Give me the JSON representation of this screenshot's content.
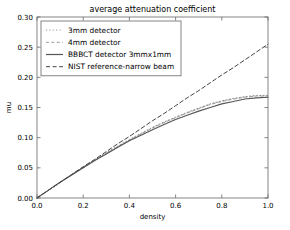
{
  "chart_data": {
    "type": "line",
    "title": "average attenuation coefficient",
    "xlabel": "density",
    "ylabel": "mu",
    "xlim": [
      0.0,
      1.0
    ],
    "ylim": [
      0.0,
      0.3
    ],
    "xticks": [
      "0.0",
      "0.2",
      "0.4",
      "0.6",
      "0.8",
      "1.0"
    ],
    "xtick_values": [
      0.0,
      0.2,
      0.4,
      0.6,
      0.8,
      1.0
    ],
    "yticks": [
      "0.00",
      "0.05",
      "0.10",
      "0.15",
      "0.20",
      "0.25",
      "0.30"
    ],
    "ytick_values": [
      0.0,
      0.05,
      0.1,
      0.15,
      0.2,
      0.25,
      0.3
    ],
    "grid": false,
    "legend_position": "upper left",
    "x": [
      0.0,
      0.05,
      0.1,
      0.15,
      0.2,
      0.25,
      0.3,
      0.35,
      0.4,
      0.45,
      0.5,
      0.55,
      0.6,
      0.65,
      0.7,
      0.75,
      0.8,
      0.85,
      0.9,
      0.95,
      1.0
    ],
    "series": [
      {
        "name": "3mm detector",
        "style": "dotted",
        "color": "#888888",
        "values": [
          0.0,
          0.013,
          0.026,
          0.039,
          0.051,
          0.063,
          0.075,
          0.086,
          0.097,
          0.107,
          0.117,
          0.126,
          0.134,
          0.142,
          0.149,
          0.156,
          0.161,
          0.165,
          0.168,
          0.17,
          0.17
        ]
      },
      {
        "name": "4mm detector",
        "style": "dashed",
        "color": "#999999",
        "values": [
          0.0,
          0.013,
          0.026,
          0.038,
          0.05,
          0.062,
          0.074,
          0.085,
          0.096,
          0.106,
          0.116,
          0.125,
          0.133,
          0.141,
          0.148,
          0.155,
          0.16,
          0.164,
          0.167,
          0.169,
          0.169
        ]
      },
      {
        "name": "BBBCT detector 3mmx1mm",
        "style": "solid",
        "color": "#555555",
        "values": [
          0.0,
          0.013,
          0.026,
          0.038,
          0.05,
          0.062,
          0.073,
          0.084,
          0.095,
          0.104,
          0.113,
          0.122,
          0.13,
          0.137,
          0.144,
          0.15,
          0.156,
          0.16,
          0.164,
          0.166,
          0.167
        ]
      },
      {
        "name": "NIST reference-narrow beam",
        "style": "dashed-long",
        "color": "#444444",
        "values": [
          0.0,
          0.013,
          0.026,
          0.039,
          0.052,
          0.064,
          0.077,
          0.09,
          0.102,
          0.115,
          0.128,
          0.14,
          0.153,
          0.166,
          0.178,
          0.191,
          0.204,
          0.216,
          0.229,
          0.242,
          0.255
        ]
      }
    ]
  },
  "legend": {
    "items": [
      {
        "label": "3mm detector"
      },
      {
        "label": "4mm detector"
      },
      {
        "label": "BBBCT detector 3mmx1mm"
      },
      {
        "label": "NIST reference-narrow beam"
      }
    ]
  }
}
